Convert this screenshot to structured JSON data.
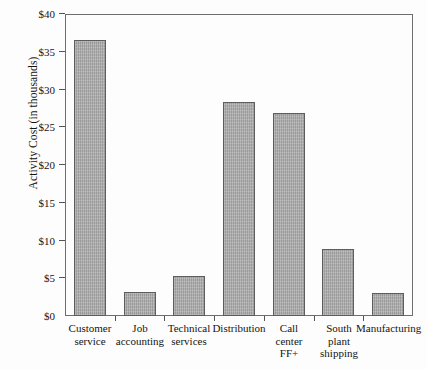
{
  "chart_data": {
    "type": "bar",
    "title": "",
    "xlabel": "",
    "ylabel": "Activity Cost (in thousands)",
    "ylim": [
      0,
      40
    ],
    "ytick_values": [
      40,
      35,
      30,
      25,
      20,
      15,
      10,
      5,
      0
    ],
    "ytick_labels": [
      "$40",
      "$35",
      "$30",
      "$25",
      "$20",
      "$15",
      "$10",
      "$5",
      "$0"
    ],
    "grid": false,
    "legend": "none",
    "bar_color": "#a9a9a9",
    "bar_edge_color": "#5d5d5d",
    "axis_color": "#6e6e6e",
    "background_color": "#fdfdfd",
    "categories": [
      "Customer service",
      "Job accounting",
      "Technical services",
      "Distribution",
      "Call center FF+",
      "South plant shipping",
      "Manufacturing"
    ],
    "category_lines": [
      [
        "Customer",
        "service"
      ],
      [
        "Job",
        "accounting"
      ],
      [
        "Technical",
        "services"
      ],
      [
        "Distribution"
      ],
      [
        "Call",
        "center",
        "FF+"
      ],
      [
        "South",
        "plant",
        "shipping"
      ],
      [
        "Manufacturing"
      ]
    ],
    "values": [
      36.6,
      3.2,
      5.3,
      28.3,
      26.9,
      8.9,
      3.1
    ]
  }
}
